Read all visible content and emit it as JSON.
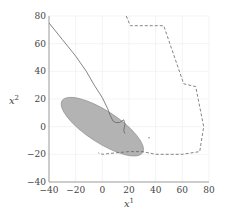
{
  "chart_data": {
    "type": "line",
    "title": "",
    "xlabel": "x^1",
    "ylabel": "x^2",
    "xlim": [
      -40,
      80
    ],
    "ylim": [
      -40,
      80
    ],
    "xticks": [
      -40,
      -20,
      0,
      20,
      40,
      60,
      80
    ],
    "yticks": [
      -40,
      -20,
      0,
      20,
      40,
      60,
      80
    ],
    "grid": true,
    "legend": null,
    "series": [
      {
        "name": "trajectory",
        "style": "solid",
        "color": "#666666",
        "points": [
          [
            -40,
            75
          ],
          [
            -30,
            63
          ],
          [
            -20,
            51
          ],
          [
            -12,
            40
          ],
          [
            -6,
            30
          ],
          [
            0,
            21
          ],
          [
            4,
            13
          ],
          [
            6,
            8
          ],
          [
            8,
            4
          ],
          [
            10,
            3
          ],
          [
            13,
            3
          ],
          [
            16,
            5
          ],
          [
            17,
            2
          ],
          [
            16,
            -3
          ],
          [
            17,
            -5
          ]
        ]
      },
      {
        "name": "boundary",
        "style": "dashed",
        "color": "#666666",
        "points": [
          [
            18,
            80
          ],
          [
            21,
            73
          ],
          [
            46,
            73
          ],
          [
            61,
            31
          ],
          [
            70,
            29
          ],
          [
            76,
            0
          ],
          [
            73,
            -18
          ],
          [
            60,
            -20
          ],
          [
            40,
            -20
          ],
          [
            30,
            -18
          ],
          [
            20,
            -18
          ],
          [
            10,
            -19
          ],
          [
            0,
            -20
          ],
          [
            -3,
            -19
          ]
        ]
      },
      {
        "name": "marker",
        "style": "point",
        "color": "#888888",
        "points": [
          [
            35,
            -8
          ]
        ]
      }
    ],
    "shapes": [
      {
        "name": "ellipse-region",
        "type": "ellipse",
        "center": [
          0,
          0
        ],
        "semi_axes": [
          36,
          12
        ],
        "rotation_deg": -33,
        "fill": "#b3b3b3",
        "stroke": "#888888"
      }
    ]
  }
}
